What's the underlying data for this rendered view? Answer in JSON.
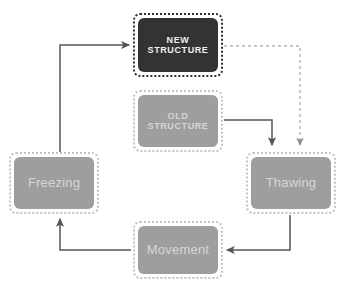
{
  "diagram": {
    "type": "cycle-flow-diagram",
    "canvas": {
      "width": 345,
      "height": 288,
      "background": "#ffffff"
    },
    "palette": {
      "dark_fill": "#333333",
      "dark_border": "#2b2b2b",
      "gray_fill": "#9e9e9e",
      "gray_border": "#bdbdbd",
      "dark_text": "#f2f2f2",
      "gray_text": "#cfcfcf",
      "connector": "#555555",
      "connector_dashed": "#b5b5b5"
    },
    "nodes": [
      {
        "id": "new-structure",
        "label": "NEW\nSTRUCTURE",
        "style": "dark",
        "x": 133,
        "y": 13,
        "w": 90,
        "h": 64,
        "fill": "#333333",
        "border": "#2f2f2f",
        "text_color": "#f0f0f0",
        "label_class": "label-caps"
      },
      {
        "id": "old-structure",
        "label": "OLD\nSTRUCTURE",
        "style": "gray",
        "x": 133,
        "y": 90,
        "w": 90,
        "h": 62,
        "fill": "#9e9e9e",
        "border": "#c4c4c4",
        "text_color": "#d6d6d6",
        "label_class": "label-caps"
      },
      {
        "id": "freezing",
        "label": "Freezing",
        "style": "gray",
        "x": 9,
        "y": 152,
        "w": 90,
        "h": 62,
        "fill": "#9e9e9e",
        "border": "#c4c4c4",
        "text_color": "#d6d6d6",
        "label_class": "label-title"
      },
      {
        "id": "thawing",
        "label": "Thawing",
        "style": "gray",
        "x": 246,
        "y": 152,
        "w": 90,
        "h": 62,
        "fill": "#9e9e9e",
        "border": "#c4c4c4",
        "text_color": "#d6d6d6",
        "label_class": "label-title"
      },
      {
        "id": "movement",
        "label": "Movement",
        "style": "gray",
        "x": 133,
        "y": 221,
        "w": 90,
        "h": 58,
        "fill": "#9e9e9e",
        "border": "#c4c4c4",
        "text_color": "#d6d6d6",
        "label_class": "label-title"
      }
    ],
    "connectors": [
      {
        "id": "freezing-to-new-structure",
        "from": "freezing",
        "to": "new-structure",
        "style": "solid",
        "color": "#555555",
        "arrow": true,
        "points": "60,152 60,45 129,45"
      },
      {
        "id": "new-structure-to-thawing",
        "from": "new-structure",
        "to": "thawing",
        "style": "dashed",
        "color": "#b5b5b5",
        "arrow": true,
        "points": "224,46 300,46 300,145"
      },
      {
        "id": "old-structure-to-thawing",
        "from": "old-structure",
        "to": "thawing",
        "style": "solid",
        "color": "#555555",
        "arrow": true,
        "points": "224,120 272,120 272,145"
      },
      {
        "id": "thawing-to-movement",
        "from": "thawing",
        "to": "movement",
        "style": "solid",
        "color": "#555555",
        "arrow": true,
        "points": "290,215 290,250 227,250"
      },
      {
        "id": "movement-to-freezing",
        "from": "movement",
        "to": "freezing",
        "style": "solid",
        "color": "#555555",
        "arrow": true,
        "points": "131,250 60,250 60,219"
      }
    ]
  }
}
